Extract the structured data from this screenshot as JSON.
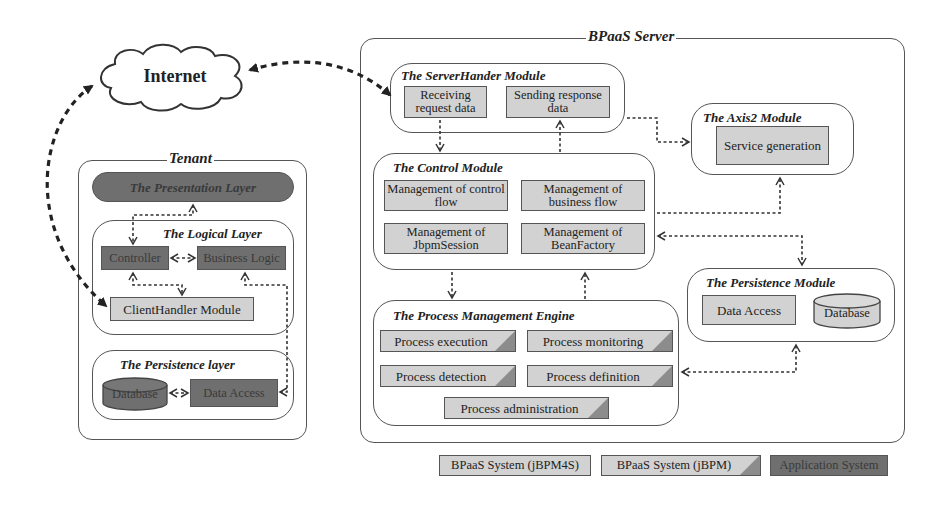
{
  "internet": {
    "label": "Internet"
  },
  "tenant": {
    "title": "Tenant",
    "presentation_layer": {
      "label": "The Presentation Layer"
    },
    "logical_layer": {
      "title": "The Logical Layer",
      "controller": "Controller",
      "business_logic": "Business Logic",
      "client_handler": "ClientHandler Module"
    },
    "persistence_layer": {
      "title": "The Persistence layer",
      "database": "Database",
      "data_access": "Data Access"
    }
  },
  "server": {
    "title": "BPaaS Server",
    "server_handler": {
      "title": "The ServerHander Module",
      "items": [
        "Receiving request data",
        "Sending response data"
      ]
    },
    "axis2": {
      "title": "The Axis2 Module",
      "items": [
        "Service generation"
      ]
    },
    "control": {
      "title": "The Control Module",
      "items": [
        "Management of control flow",
        "Management of business flow",
        "Management of JbpmSession",
        "Management of BeanFactory"
      ]
    },
    "persistence": {
      "title": "The Persistence Module",
      "data_access": "Data Access",
      "database": "Database"
    },
    "engine": {
      "title": "The Process Management Engine",
      "items": [
        "Process execution",
        "Process monitoring",
        "Process detection",
        "Process definition",
        "Process administration"
      ]
    }
  },
  "legend": {
    "items": [
      {
        "label": "BPaaS System (jBPM4S)",
        "style": "light"
      },
      {
        "label": "BPaaS System (jBPM)",
        "style": "light-corner"
      },
      {
        "label": "Application System",
        "style": "dark"
      }
    ]
  },
  "colors": {
    "light_box": "#d2d2d2",
    "dark_box": "#6f6f6f",
    "corner": "#8c8c8c",
    "line": "#333333"
  }
}
